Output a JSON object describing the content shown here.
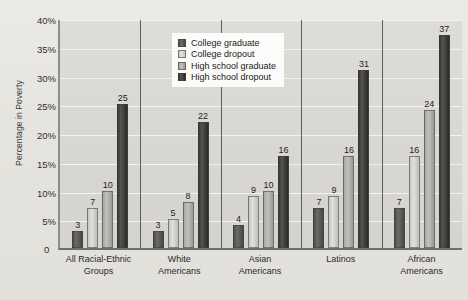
{
  "chart_data": {
    "type": "bar",
    "title": "",
    "xlabel": "",
    "ylabel": "Percentage in Poverty",
    "ylim": [
      0,
      40
    ],
    "ytick_labels": [
      "40%",
      "35%",
      "30%",
      "25%",
      "20%",
      "15%",
      "10%",
      "5%",
      "0"
    ],
    "ytick_values": [
      40,
      35,
      30,
      25,
      20,
      15,
      10,
      5,
      0
    ],
    "grid": true,
    "legend_position": "top-center",
    "categories": [
      "All Racial-Ethnic Groups",
      "White Americans",
      "Asian Americans",
      "Latinos",
      "African Americans"
    ],
    "category_lines": [
      [
        "All Racial-Ethnic",
        "Groups"
      ],
      [
        "White",
        "Americans"
      ],
      [
        "Asian",
        "Americans"
      ],
      [
        "Latinos",
        ""
      ],
      [
        "African",
        "Americans"
      ]
    ],
    "series": [
      {
        "name": "College graduate",
        "color": "#514f4d",
        "values": [
          3,
          3,
          4,
          7,
          7
        ]
      },
      {
        "name": "College dropout",
        "color": "#cecbc6",
        "values": [
          7,
          5,
          9,
          9,
          16
        ]
      },
      {
        "name": "High school graduate",
        "color": "#a9a7a2",
        "values": [
          10,
          8,
          10,
          16,
          24
        ]
      },
      {
        "name": "High school dropout",
        "color": "#3c3a38",
        "values": [
          25,
          22,
          16,
          31,
          37
        ]
      }
    ]
  },
  "axis": {
    "zero_label": "0"
  },
  "colors": {
    "page_background": "#e9e8e4",
    "plot_background": "#d9d7d2",
    "gridline": "#f4f3f1",
    "axis": "#6e6e6b",
    "legend_background": "#fbfbfa",
    "text": "#23221f"
  }
}
